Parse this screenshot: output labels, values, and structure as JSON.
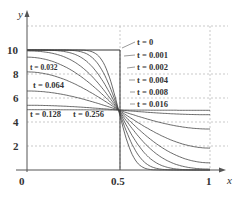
{
  "chart_data": {
    "type": "line",
    "title": "",
    "xlabel": "x",
    "ylabel": "y",
    "xlim": [
      0,
      1
    ],
    "ylim": [
      0,
      12
    ],
    "grid": "dashed",
    "x_ticks": [
      "0",
      "0.5",
      "1"
    ],
    "y_ticks": [
      "2",
      "4",
      "6",
      "8",
      "10"
    ],
    "initial_condition": {
      "left_value": 10,
      "right_value": 0,
      "split_x": 0.5
    },
    "convergence_point": {
      "x": 0.5,
      "y": 5
    },
    "series": [
      {
        "name": "t = 0",
        "t": 0
      },
      {
        "name": "t = 0.001",
        "t": 0.001
      },
      {
        "name": "t = 0.002",
        "t": 0.002
      },
      {
        "name": "t = 0.004",
        "t": 0.004
      },
      {
        "name": "t = 0.008",
        "t": 0.008
      },
      {
        "name": "t = 0.016",
        "t": 0.016
      },
      {
        "name": "t = 0.032",
        "t": 0.032
      },
      {
        "name": "t = 0.064",
        "t": 0.064
      },
      {
        "name": "t = 0.128",
        "t": 0.128
      },
      {
        "name": "t = 0.256",
        "t": 0.256
      }
    ],
    "endpoint_values_at_x1": {
      "t = 0.256": 4.5,
      "t = 0.128": 3.9,
      "t = 0.064": 2.3,
      "t = 0.032": 1.0,
      "t = 0.016": 0.3
    }
  },
  "labels": {
    "y_axis": "y",
    "x_axis": "x",
    "origin": "0",
    "x_half": "0.5",
    "x_one": "1",
    "y2": "2",
    "y4": "4",
    "y6": "6",
    "y8": "8",
    "y10": "10",
    "t0": "t = 0",
    "t001": "t = 0.001",
    "t002": "t = 0.002",
    "t004": "t = 0.004",
    "t008": "t = 0.008",
    "t016": "t = 0.016",
    "t032": "t = 0.032",
    "t064": "t = 0.064",
    "t128": "t = 0.128",
    "t256": "t = 0.256"
  },
  "colors": {
    "axis": "#555555",
    "curve": "#444444",
    "grid": "#bbbbbb"
  }
}
